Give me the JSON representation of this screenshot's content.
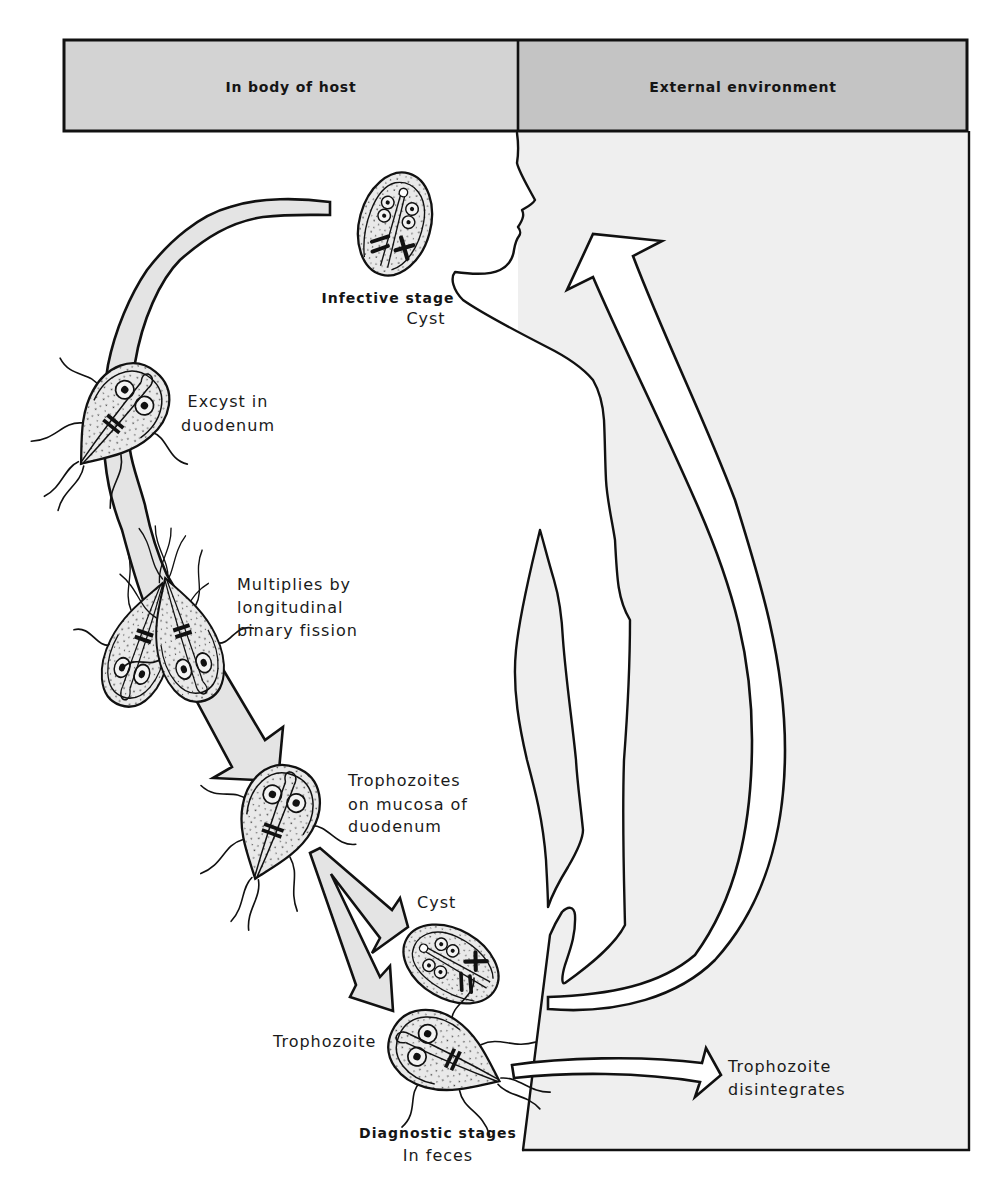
{
  "diagram": {
    "headers": {
      "host": "In body of host",
      "external": "External environment"
    },
    "stages": {
      "infective": {
        "title": "Infective stage",
        "form": "Cyst"
      },
      "excyst": {
        "line1": "Excyst in",
        "line2": "duodenum"
      },
      "multiplies": {
        "line1": "Multiplies by",
        "line2": "longitudinal",
        "line3": "binary fission"
      },
      "trophozoites": {
        "line1": "Trophozoites",
        "line2": "on mucosa of",
        "line3": "duodenum"
      },
      "cyst_label": "Cyst",
      "trophozoite_label": "Trophozoite",
      "diagnostic": {
        "title": "Diagnostic stages",
        "location": "In feces"
      },
      "disintegrates": {
        "line1": "Trophozoite",
        "line2": "disintegrates"
      }
    }
  },
  "colors": {
    "host_header": "#d3d3d3",
    "external_header": "#c4c4c4",
    "external_background": "#efefef",
    "arrow_fill": "#e4e4e4",
    "outline": "#111111"
  }
}
